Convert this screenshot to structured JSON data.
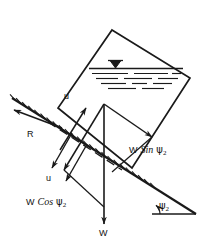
{
  "figure": {
    "type": "free-body-diagram",
    "ink_color": "#1a1a1a",
    "background": "#ffffff"
  },
  "labels": {
    "velocity_upper": "u",
    "velocity_lower": "u",
    "reaction": "R",
    "weight": "W",
    "w_sin_prefix": "W",
    "w_sin_fn": "Sin",
    "w_sin_angle": "ψ",
    "w_sin_sub": "2",
    "w_cos_prefix": "W",
    "w_cos_fn": "Cos",
    "w_cos_angle": "ψ",
    "w_cos_sub": "2",
    "slope_angle": "ψ",
    "slope_angle_sub": "2"
  },
  "geometry": {
    "tank_corners": "112,30 190,78 132,168 58,108",
    "water_surface_line": "90,70 182,70",
    "slope_line": "12,98 196,214",
    "horizontal_line": "152,214 196,214",
    "weight_arrow": "104,105 104,224",
    "angle_degrees": 32
  }
}
